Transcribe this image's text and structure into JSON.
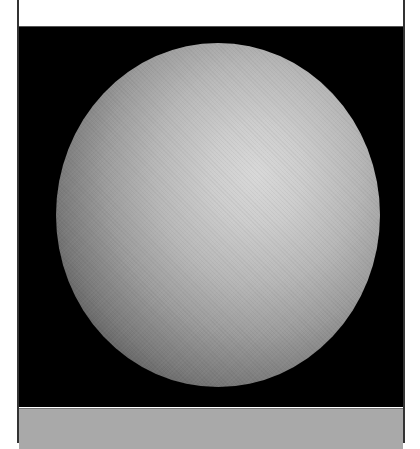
{
  "figure": {
    "background_color": "#000000",
    "sphere_highlight_color": "#d6d6d6",
    "sphere_shadow_color": "#151515",
    "top_strip_color": "#ffffff",
    "bottom_strip_color": "#a9a9a9",
    "frame_color": "#333333"
  }
}
